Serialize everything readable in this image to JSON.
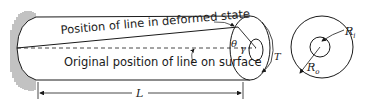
{
  "figure": {
    "type": "torsion-of-hollow-shaft",
    "labels": {
      "deformed_line": "Position of line in deformed state",
      "original_line": "Original position of line on surface",
      "length": "L",
      "angle_theta": "θ",
      "angle_gamma": "γ",
      "torque": "T",
      "inner_radius": "R",
      "inner_radius_sub": "i",
      "outer_radius": "R",
      "outer_radius_sub": "o"
    },
    "colors": {
      "stroke": "#1a1a1a",
      "background": "#ffffff"
    }
  }
}
